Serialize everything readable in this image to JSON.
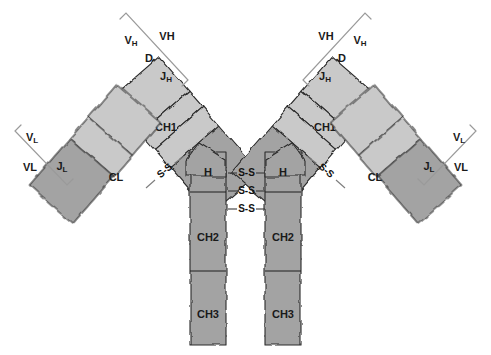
{
  "figure": {
    "background_color": "#ffffff",
    "variable_domain_color": "#c9c9c9",
    "constant_domain_color": "#a3a3a3",
    "outline_color": "#2b2b2b",
    "bracket_color": "#9a9a9a",
    "label_color": "#1a1a1a"
  },
  "domains": {
    "heavy_left": {
      "ch1": "CH1",
      "hinge": "H",
      "ch2": "CH2",
      "ch3": "CH3"
    },
    "heavy_right": {
      "ch1": "CH1",
      "hinge": "H",
      "ch2": "CH2",
      "ch3": "CH3"
    },
    "light_left": {
      "cl": "CL"
    },
    "light_right": {
      "cl": "CL"
    }
  },
  "gene_segments": {
    "heavy_left": {
      "v": "V",
      "v_sub": "H",
      "d": "D",
      "j": "J",
      "j_sub": "H",
      "region": "VH"
    },
    "heavy_right": {
      "v": "V",
      "v_sub": "H",
      "d": "D",
      "j": "J",
      "j_sub": "H",
      "region": "VH"
    },
    "light_left": {
      "v": "V",
      "v_sub": "L",
      "j": "J",
      "j_sub": "L",
      "region": "VL"
    },
    "light_right": {
      "v": "V",
      "v_sub": "L",
      "j": "J",
      "j_sub": "L",
      "region": "VL"
    }
  },
  "disulfide_bonds": {
    "label": "S-S",
    "hinge_bonds": [
      "S-S",
      "S-S",
      "S-S"
    ],
    "hinge_count": 3,
    "interchain_left": "S-S",
    "interchain_right": "S-S"
  }
}
